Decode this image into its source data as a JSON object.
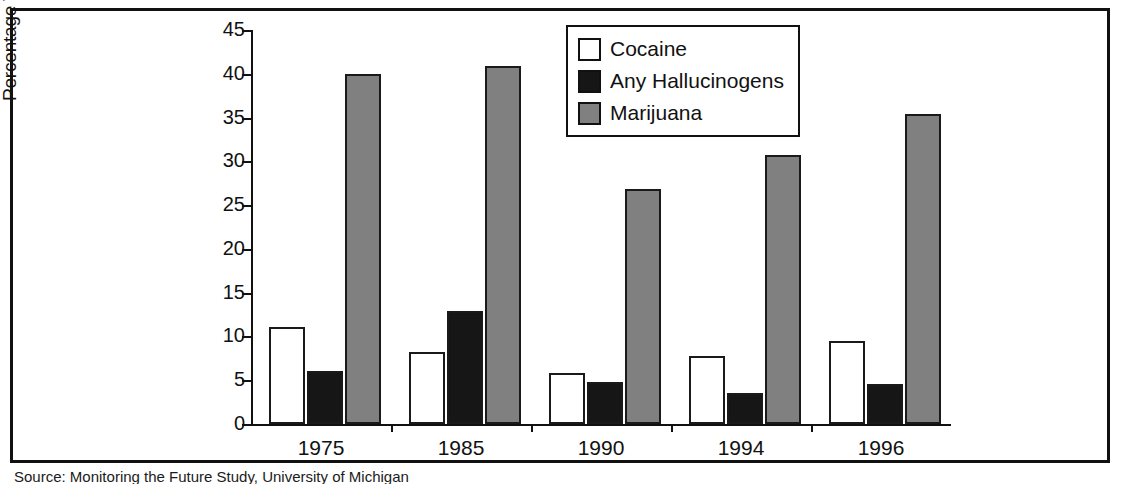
{
  "figure": {
    "source_note": "Source: Monitoring the Future Study, University of Michigan"
  },
  "legend": {
    "items": [
      {
        "label": "Cocaine",
        "swatch": "white-square-icon",
        "color": "#ffffff"
      },
      {
        "label": "Any Hallucinogens",
        "swatch": "black-square-icon",
        "color": "#161616"
      },
      {
        "label": "Marijuana",
        "swatch": "gray-square-icon",
        "color": "#808080"
      }
    ]
  },
  "chart_data": {
    "type": "bar",
    "title": "",
    "xlabel": "",
    "ylabel": "Percentage Who Reported Use",
    "categories": [
      "1975",
      "1985",
      "1990",
      "1994",
      "1996"
    ],
    "series": [
      {
        "name": "Cocaine",
        "color": "#ffffff",
        "values": [
          11.1,
          8.2,
          5.8,
          7.8,
          9.5
        ]
      },
      {
        "name": "Any Hallucinogens",
        "color": "#161616",
        "values": [
          6.1,
          12.9,
          4.8,
          3.5,
          4.6
        ]
      },
      {
        "name": "Marijuana",
        "color": "#808080",
        "values": [
          40.0,
          40.9,
          26.8,
          30.7,
          35.4
        ]
      }
    ],
    "ylim": [
      0,
      45
    ],
    "ytick_step": 5,
    "yticks": [
      "45",
      "40",
      "35",
      "30",
      "25",
      "20",
      "15",
      "10",
      "5",
      "0"
    ],
    "grid": false,
    "legend_position": "top-right-inside"
  }
}
